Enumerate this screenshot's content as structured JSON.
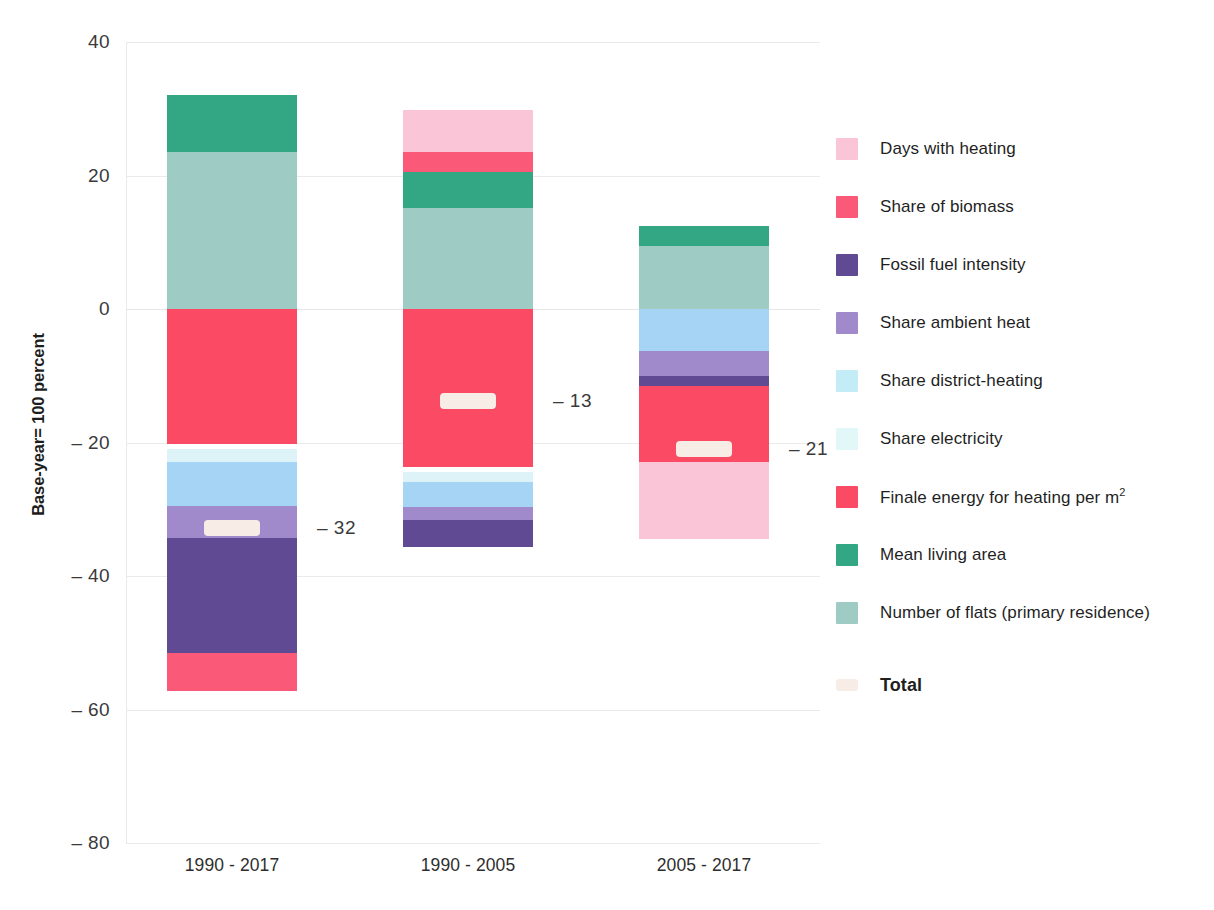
{
  "chart_data": {
    "type": "bar",
    "subtype": "stacked-waterfall-decomposition",
    "title": "",
    "xlabel": "",
    "ylabel": "Base-year= 100 percent",
    "ylim": [
      -80,
      40
    ],
    "yticks": [
      40,
      20,
      0,
      -20,
      -40,
      -60,
      -80
    ],
    "ytick_labels": [
      "40",
      "20",
      "0",
      "– 20",
      "– 40",
      "– 60",
      "– 80"
    ],
    "grid": true,
    "legend_position": "right",
    "categories": [
      "1990 - 2017",
      "1990 - 2005",
      "2005 - 2017"
    ],
    "series": [
      {
        "name": "Days with heating",
        "color": "#fac6d7",
        "values": [
          0.0,
          6.3,
          -11.6
        ]
      },
      {
        "name": "Share of biomass",
        "color": "#fa5a78",
        "values": [
          -5.7,
          3.0,
          0.0
        ]
      },
      {
        "name": "Fossil fuel intensity",
        "color": "#5f4a93",
        "values": [
          -17.3,
          -4.0,
          -1.5
        ]
      },
      {
        "name": "Share ambient heat",
        "color": "#a08acb",
        "values": [
          -4.8,
          -2.0,
          -3.8
        ]
      },
      {
        "name": "Share district-heating",
        "color": "#a5d4f5",
        "values": [
          -6.5,
          -3.8,
          -6.3
        ]
      },
      {
        "name": "Share electricity",
        "color": "#ddf3f7",
        "values": [
          -2.0,
          -1.5,
          0.0
        ]
      },
      {
        "name": "Finale energy for heating per m2",
        "color": "#fb4a63",
        "values": [
          -20.2,
          -23.6,
          -11.3
        ]
      },
      {
        "name": "Mean living area",
        "color": "#33a684",
        "values": [
          8.5,
          5.3,
          3.0
        ]
      },
      {
        "name": "Number of flats (primary residence)",
        "color": "#9ecbc3",
        "values": [
          23.5,
          15.2,
          9.5
        ]
      }
    ],
    "totals": [
      -32,
      -13,
      -21
    ],
    "total_labels": [
      "– 32",
      "– 13",
      "– 21"
    ],
    "total_color": "#f7ece6"
  },
  "legend": {
    "items": [
      {
        "label": "Days with heating",
        "color": "#fac6d7",
        "bold": false,
        "sup": ""
      },
      {
        "label": "Share of biomass",
        "color": "#fa5a78",
        "bold": false,
        "sup": ""
      },
      {
        "label": "Fossil fuel intensity",
        "color": "#5f4a93",
        "bold": false,
        "sup": ""
      },
      {
        "label": "Share ambient heat",
        "color": "#a08acb",
        "bold": false,
        "sup": ""
      },
      {
        "label": "Share district-heating",
        "color": "#c3ecf7",
        "bold": false,
        "sup": ""
      },
      {
        "label": "Share electricity",
        "color": "#e2f7f8",
        "bold": false,
        "sup": ""
      },
      {
        "label": "Finale energy for heating per m",
        "color": "#fb4a63",
        "bold": false,
        "sup": "2"
      },
      {
        "label": "Mean living area",
        "color": "#33a684",
        "bold": false,
        "sup": ""
      },
      {
        "label": "Number of flats (primary residence)",
        "color": "#9ecbc3",
        "bold": false,
        "sup": ""
      },
      {
        "label": "Total",
        "color": "#f7ece6",
        "bold": true,
        "sup": ""
      }
    ]
  }
}
